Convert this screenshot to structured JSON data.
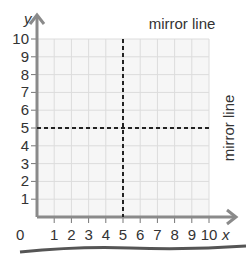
{
  "diagram": {
    "type": "coordinate-grid",
    "x_axis": {
      "label": "x",
      "ticks": [
        "1",
        "2",
        "3",
        "4",
        "5",
        "6",
        "7",
        "8",
        "9",
        "10"
      ],
      "range": [
        0,
        10
      ]
    },
    "y_axis": {
      "label": "y",
      "ticks": [
        "1",
        "2",
        "3",
        "4",
        "5",
        "6",
        "7",
        "8",
        "9",
        "10"
      ],
      "range": [
        0,
        10
      ]
    },
    "origin_label": "0",
    "mirror_lines": [
      {
        "orientation": "vertical",
        "at": 5,
        "label": "mirror line"
      },
      {
        "orientation": "horizontal",
        "at": 5,
        "label": "mirror line"
      }
    ],
    "colors": {
      "grid": "#dddddd",
      "axis": "#888888",
      "mirror": "#222222",
      "text": "#333333"
    }
  }
}
